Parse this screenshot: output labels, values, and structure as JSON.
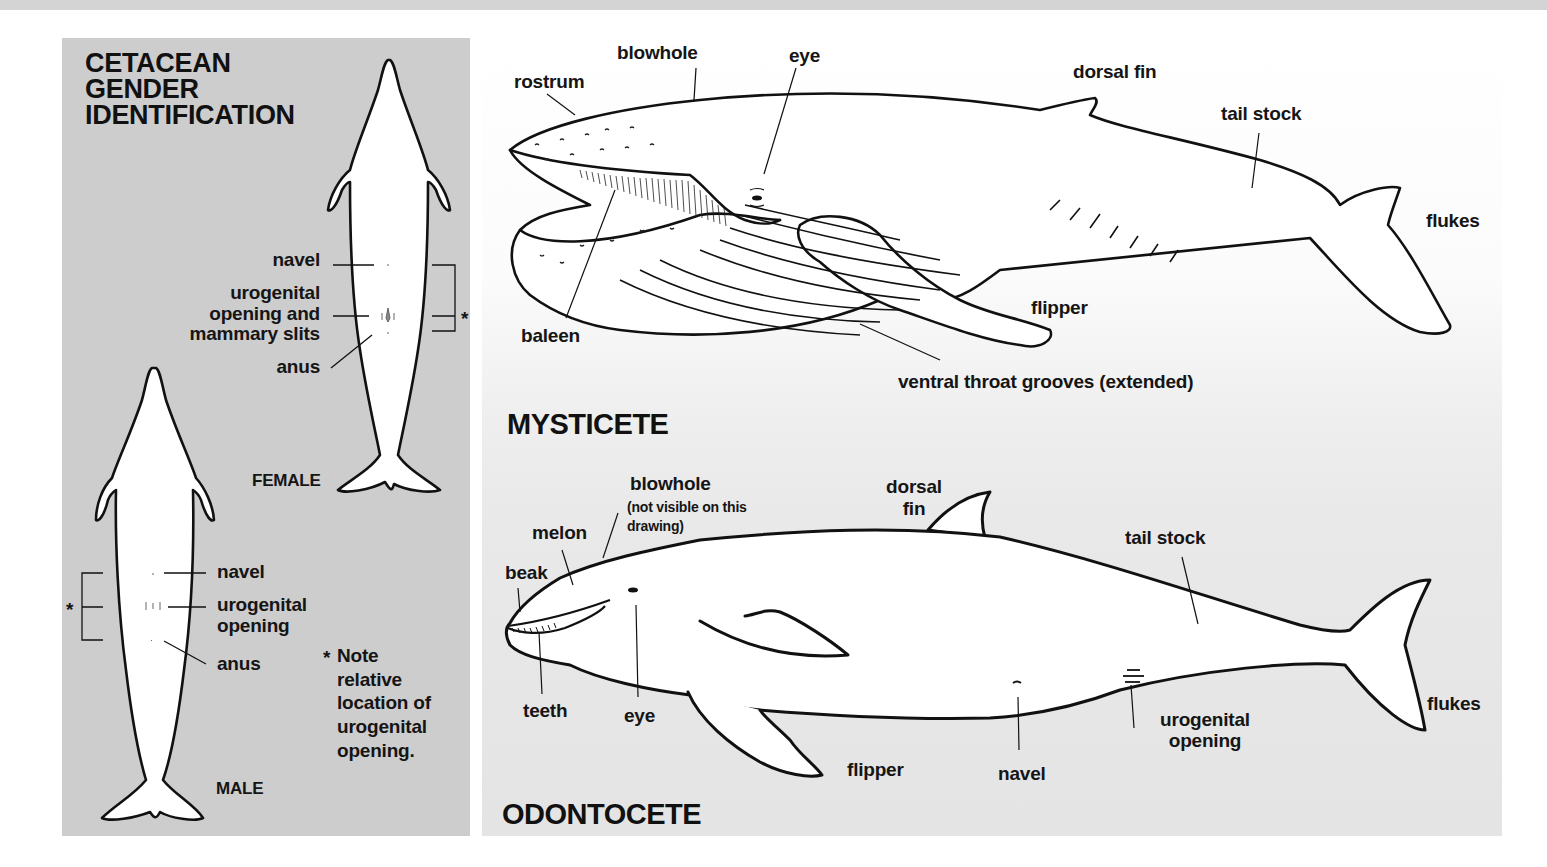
{
  "gender_panel": {
    "title": "CETACEAN\nGENDER\nIDENTIFICATION",
    "female": {
      "caption": "FEMALE",
      "labels": {
        "navel": "navel",
        "urogenital_1": "urogenital",
        "urogenital_2": "opening and",
        "urogenital_3": "mammary slits",
        "anus": "anus"
      },
      "bracket_marker": "*"
    },
    "male": {
      "caption": "MALE",
      "labels": {
        "navel": "navel",
        "urogenital_1": "urogenital",
        "urogenital_2": "opening",
        "anus": "anus"
      },
      "bracket_marker": "*"
    },
    "note": {
      "marker": "*",
      "line1": "Note",
      "line2": "relative",
      "line3": "location of",
      "line4": "urogenital",
      "line5": "opening."
    }
  },
  "mysticete": {
    "title": "MYSTICETE",
    "labels": {
      "rostrum": "rostrum",
      "blowhole": "blowhole",
      "eye": "eye",
      "dorsal_fin": "dorsal fin",
      "tail_stock": "tail stock",
      "flukes": "flukes",
      "flipper": "flipper",
      "baleen": "baleen",
      "ventral_throat_grooves": "ventral throat grooves (extended)"
    }
  },
  "odontocete": {
    "title": "ODONTOCETE",
    "labels": {
      "blowhole": "blowhole",
      "blowhole_note_1": "(not visible on this",
      "blowhole_note_2": "drawing)",
      "dorsal_fin_1": "dorsal",
      "dorsal_fin_2": "fin",
      "melon": "melon",
      "beak": "beak",
      "tail_stock": "tail stock",
      "teeth": "teeth",
      "eye": "eye",
      "flipper": "flipper",
      "navel": "navel",
      "urogenital_1": "urogenital",
      "urogenital_2": "opening",
      "flukes": "flukes"
    }
  },
  "colors": {
    "left_panel_bg": "#cdcdcd",
    "right_panel_top": "#ffffff",
    "right_panel_bottom": "#e4e4e4",
    "ink": "#111111"
  }
}
